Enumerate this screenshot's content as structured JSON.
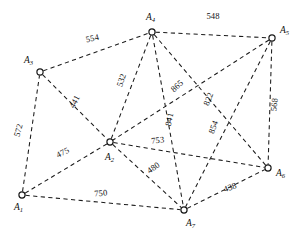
{
  "figure": {
    "type": "undirected-weighted-graph",
    "background": "#ffffff",
    "edge_color": "#1a1a1a",
    "node_fill": "#ffffff",
    "node_stroke": "#1a1a1a",
    "edge_style": "dashed"
  },
  "chart_data": {
    "type": "diagram",
    "title": "",
    "xlabel": "",
    "ylabel": "",
    "grid": false,
    "legend": null,
    "nodes": [
      {
        "id": "A1",
        "base": "A",
        "sub": "1",
        "x": 22,
        "y": 195,
        "label_x": 14,
        "label_y": 210
      },
      {
        "id": "A2",
        "base": "A",
        "sub": "2",
        "x": 110,
        "y": 142,
        "label_x": 105,
        "label_y": 160
      },
      {
        "id": "A3",
        "base": "A",
        "sub": "3",
        "x": 40,
        "y": 72,
        "label_x": 24,
        "label_y": 63
      },
      {
        "id": "A4",
        "base": "A",
        "sub": "4",
        "x": 152,
        "y": 32,
        "label_x": 146,
        "label_y": 20
      },
      {
        "id": "A5",
        "base": "A",
        "sub": "5",
        "x": 272,
        "y": 38,
        "label_x": 280,
        "label_y": 33
      },
      {
        "id": "A6",
        "base": "A",
        "sub": "6",
        "x": 268,
        "y": 168,
        "label_x": 276,
        "label_y": 176
      },
      {
        "id": "A7",
        "base": "A",
        "sub": "7",
        "x": 184,
        "y": 210,
        "label_x": 186,
        "label_y": 226
      }
    ],
    "edges": [
      {
        "from": "A3",
        "to": "A4",
        "weight": "554",
        "label_x": 93,
        "label_y": 41,
        "rotate": -13
      },
      {
        "from": "A4",
        "to": "A5",
        "weight": "548",
        "label_x": 213,
        "label_y": 19,
        "rotate": 0
      },
      {
        "from": "A1",
        "to": "A3",
        "weight": "572",
        "label_x": 21,
        "label_y": 131,
        "rotate": -74
      },
      {
        "from": "A3",
        "to": "A2",
        "weight": "441",
        "label_x": 77,
        "label_y": 103,
        "rotate": -62
      },
      {
        "from": "A1",
        "to": "A2",
        "weight": "475",
        "label_x": 64,
        "label_y": 155,
        "rotate": -27
      },
      {
        "from": "A1",
        "to": "A7",
        "weight": "750",
        "label_x": 101,
        "label_y": 196,
        "rotate": -5
      },
      {
        "from": "A2",
        "to": "A4",
        "weight": "532",
        "label_x": 124,
        "label_y": 81,
        "rotate": -72
      },
      {
        "from": "A2",
        "to": "A7",
        "weight": "480",
        "label_x": 155,
        "label_y": 170,
        "rotate": -35
      },
      {
        "from": "A2",
        "to": "A6",
        "weight": "753",
        "label_x": 158,
        "label_y": 143,
        "rotate": -6
      },
      {
        "from": "A4",
        "to": "A7",
        "weight": "841",
        "label_x": 172,
        "label_y": 120,
        "rotate": -78
      },
      {
        "from": "A4",
        "to": "A6",
        "weight": "865",
        "label_x": 179,
        "label_y": 88,
        "rotate": -42
      },
      {
        "from": "A5",
        "to": "A2",
        "weight": "822",
        "label_x": 211,
        "label_y": 100,
        "rotate": -68
      },
      {
        "from": "A5",
        "to": "A7",
        "weight": "854",
        "label_x": 216,
        "label_y": 128,
        "rotate": -70
      },
      {
        "from": "A5",
        "to": "A6",
        "weight": "568",
        "label_x": 277,
        "label_y": 105,
        "rotate": -83
      },
      {
        "from": "A7",
        "to": "A6",
        "weight": "438",
        "label_x": 231,
        "label_y": 190,
        "rotate": -20
      }
    ]
  }
}
